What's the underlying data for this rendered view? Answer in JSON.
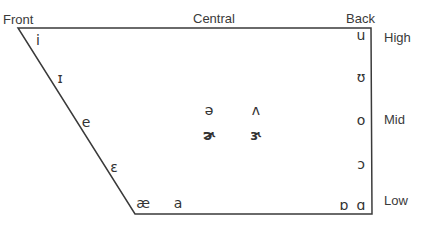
{
  "axes": {
    "front": "Front",
    "central": "Central",
    "back": "Back",
    "high": "High",
    "mid": "Mid",
    "low": "Low"
  },
  "colors": {
    "line": "#3a3a3a",
    "text": "#333333"
  },
  "shape": {
    "points": [
      [
        18,
        28
      ],
      [
        371,
        28
      ],
      [
        372,
        214
      ],
      [
        135,
        214
      ]
    ]
  },
  "vowels": [
    {
      "symbol": "i",
      "name": "close-front-unrounded",
      "x": 38,
      "y": 40
    },
    {
      "symbol": "ɪ",
      "name": "near-close-front",
      "x": 60,
      "y": 78
    },
    {
      "symbol": "e",
      "name": "close-mid-front",
      "x": 86,
      "y": 122
    },
    {
      "symbol": "ɛ",
      "name": "open-mid-front",
      "x": 114,
      "y": 167
    },
    {
      "symbol": "æ",
      "name": "near-open-front",
      "x": 143,
      "y": 203
    },
    {
      "symbol": "a",
      "name": "open-front",
      "x": 178,
      "y": 203
    },
    {
      "symbol": "ə",
      "name": "schwa",
      "x": 209,
      "y": 110
    },
    {
      "symbol": "ʌ",
      "name": "open-mid-back-unrounded",
      "x": 256,
      "y": 110
    },
    {
      "symbol": "ɚ",
      "name": "r-colored-schwa",
      "x": 209,
      "y": 135,
      "bold": true
    },
    {
      "symbol": "ɝ",
      "name": "r-colored-open-mid-central",
      "x": 256,
      "y": 135,
      "bold": true
    },
    {
      "symbol": "u",
      "name": "close-back-rounded",
      "x": 361,
      "y": 35
    },
    {
      "symbol": "ʊ",
      "name": "near-close-back",
      "x": 361,
      "y": 77
    },
    {
      "symbol": "o",
      "name": "close-mid-back",
      "x": 361,
      "y": 120
    },
    {
      "symbol": "ɔ",
      "name": "open-mid-back",
      "x": 361,
      "y": 164
    },
    {
      "symbol": "ɒ",
      "name": "open-back-rounded",
      "x": 344,
      "y": 205
    },
    {
      "symbol": "ɑ",
      "name": "open-back-unrounded",
      "x": 361,
      "y": 205
    }
  ]
}
